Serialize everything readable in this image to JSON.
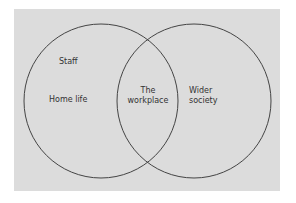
{
  "diagram": {
    "type": "venn",
    "background_color": "#dcdcdc",
    "stroke_color": "#444444",
    "circles": [
      {
        "id": "left",
        "labels": [
          "Staff",
          "Home life"
        ]
      },
      {
        "id": "right",
        "labels": [
          "Wider society"
        ]
      }
    ],
    "labels": {
      "staff": "Staff",
      "home_life": "Home life",
      "the": "The",
      "workplace": "workplace",
      "wider": "Wider",
      "society": "society"
    }
  }
}
